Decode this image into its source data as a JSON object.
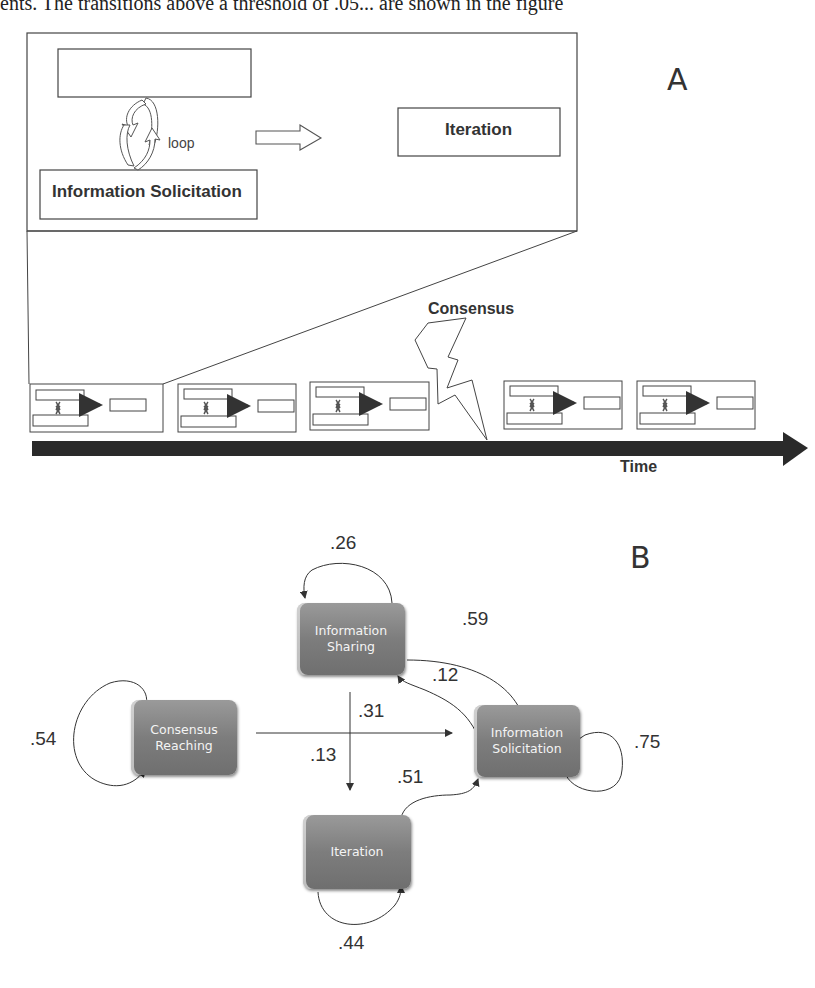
{
  "top_text": "ents. The transitions above a threshold of .05... are shown in the figure",
  "panel_a": {
    "letter": "A",
    "zoom_box": {
      "top_box_label": "",
      "loop_label": "loop",
      "bottom_box_label": "Information Solicitation",
      "right_box_label": "Iteration"
    },
    "event_label": "Consensus",
    "axis_label": "Time",
    "timeline_episode_count": 5
  },
  "panel_b": {
    "letter": "B",
    "nodes": [
      {
        "id": "sharing",
        "line1": "Information",
        "line2": "Sharing"
      },
      {
        "id": "consensus",
        "line1": "Consensus",
        "line2": "Reaching"
      },
      {
        "id": "solicitation",
        "line1": "Information",
        "line2": "Solicitation"
      },
      {
        "id": "iteration",
        "line1": "Iteration",
        "line2": ""
      }
    ],
    "edges": [
      {
        "from": "Information Sharing",
        "to": "Information Sharing",
        "weight": ".26"
      },
      {
        "from": "Information Sharing",
        "to": "Information Solicitation",
        "weight": ".59"
      },
      {
        "from": "Information Solicitation",
        "to": "Information Sharing",
        "weight": ".12"
      },
      {
        "from": "Consensus Reaching",
        "to": "Information Solicitation",
        "weight": ".31"
      },
      {
        "from": "Consensus Reaching",
        "to": "Consensus Reaching",
        "weight": ".54"
      },
      {
        "from": "Information Sharing",
        "to": "Iteration",
        "weight": ".13"
      },
      {
        "from": "Iteration",
        "to": "Information Solicitation",
        "weight": ".51"
      },
      {
        "from": "Information Solicitation",
        "to": "Information Solicitation",
        "weight": ".75"
      },
      {
        "from": "Iteration",
        "to": "Iteration",
        "weight": ".44"
      }
    ]
  }
}
